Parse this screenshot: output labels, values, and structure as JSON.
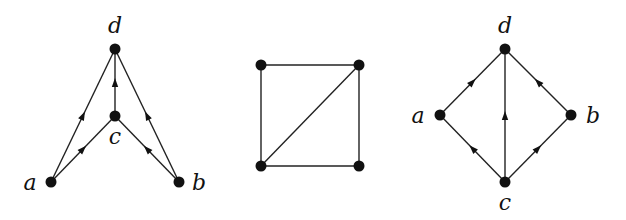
{
  "diagrams": [
    {
      "id": "graph-1",
      "type": "directed",
      "nodes": [
        {
          "id": "d",
          "label": "d",
          "x": 115,
          "y": 49,
          "lx": 115,
          "ly": 33
        },
        {
          "id": "c",
          "label": "c",
          "x": 115,
          "y": 116,
          "lx": 115,
          "ly": 144
        },
        {
          "id": "a",
          "label": "a",
          "x": 51,
          "y": 182,
          "lx": 30,
          "ly": 190
        },
        {
          "id": "b",
          "label": "b",
          "x": 179,
          "y": 182,
          "lx": 199,
          "ly": 190
        }
      ],
      "edges": [
        {
          "from": "a",
          "to": "d"
        },
        {
          "from": "a",
          "to": "c"
        },
        {
          "from": "c",
          "to": "d"
        },
        {
          "from": "b",
          "to": "c"
        },
        {
          "from": "b",
          "to": "d"
        }
      ]
    },
    {
      "id": "graph-2",
      "type": "undirected",
      "nodes": [
        {
          "id": "tl",
          "label": "",
          "x": 261,
          "y": 65
        },
        {
          "id": "tr",
          "label": "",
          "x": 359,
          "y": 65
        },
        {
          "id": "bl",
          "label": "",
          "x": 261,
          "y": 166
        },
        {
          "id": "br",
          "label": "",
          "x": 359,
          "y": 166
        }
      ],
      "edges": [
        {
          "from": "tl",
          "to": "tr"
        },
        {
          "from": "tl",
          "to": "bl"
        },
        {
          "from": "bl",
          "to": "br"
        },
        {
          "from": "tr",
          "to": "br"
        },
        {
          "from": "bl",
          "to": "tr"
        }
      ]
    },
    {
      "id": "graph-3",
      "type": "directed",
      "nodes": [
        {
          "id": "d",
          "label": "d",
          "x": 505,
          "y": 49,
          "lx": 505,
          "ly": 33
        },
        {
          "id": "a",
          "label": "a",
          "x": 440,
          "y": 115,
          "lx": 418,
          "ly": 123
        },
        {
          "id": "b",
          "label": "b",
          "x": 571,
          "y": 115,
          "lx": 593,
          "ly": 123
        },
        {
          "id": "c",
          "label": "c",
          "x": 505,
          "y": 182,
          "lx": 505,
          "ly": 210
        }
      ],
      "edges": [
        {
          "from": "a",
          "to": "d"
        },
        {
          "from": "b",
          "to": "d"
        },
        {
          "from": "c",
          "to": "d"
        },
        {
          "from": "c",
          "to": "a"
        },
        {
          "from": "c",
          "to": "b"
        }
      ]
    }
  ],
  "style": {
    "edge_color": "#222222",
    "node_color": "#111111",
    "node_radius": 5.5,
    "background": "#ffffff"
  }
}
